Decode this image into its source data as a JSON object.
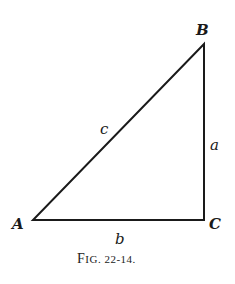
{
  "figure": {
    "caption": "Fig. 22-14.",
    "type": "right-triangle",
    "vertices": [
      {
        "name": "A",
        "x": 33,
        "y": 220
      },
      {
        "name": "B",
        "x": 204,
        "y": 44
      },
      {
        "name": "C",
        "x": 204,
        "y": 220
      }
    ],
    "sides": [
      {
        "name": "a",
        "between": "B-C"
      },
      {
        "name": "b",
        "between": "A-C"
      },
      {
        "name": "c",
        "between": "A-B"
      }
    ],
    "right_angle_at": "C"
  },
  "labels": {
    "A": "A",
    "B": "B",
    "C": "C",
    "a": "a",
    "b": "b",
    "c": "c",
    "caption_f": "F",
    "caption_rest": "IG. 22-14."
  }
}
